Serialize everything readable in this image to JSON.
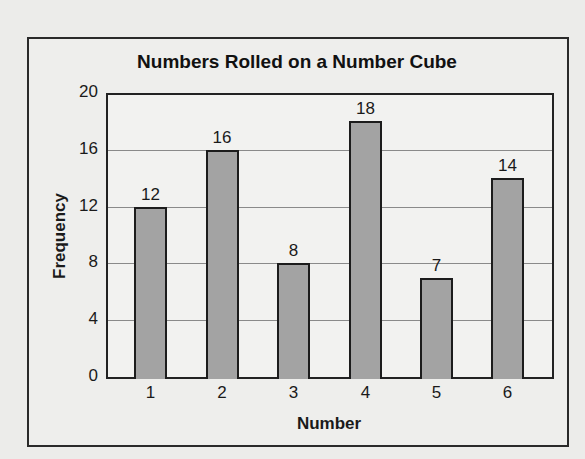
{
  "chart_data": {
    "type": "bar",
    "title": "Numbers Rolled on a Number Cube",
    "xlabel": "Number",
    "ylabel": "Frequency",
    "categories": [
      "1",
      "2",
      "3",
      "4",
      "5",
      "6"
    ],
    "values": [
      12,
      16,
      8,
      18,
      7,
      14
    ],
    "data_labels": [
      "12",
      "16",
      "8",
      "18",
      "7",
      "14"
    ],
    "ylim": [
      0,
      20
    ],
    "yticks": [
      0,
      4,
      8,
      12,
      16,
      20
    ],
    "ytick_labels": [
      "0",
      "4",
      "8",
      "12",
      "16",
      "20"
    ],
    "grid": true,
    "legend": null,
    "bar_color": "#a3a3a3",
    "grid_color": "#8a8a8a"
  }
}
